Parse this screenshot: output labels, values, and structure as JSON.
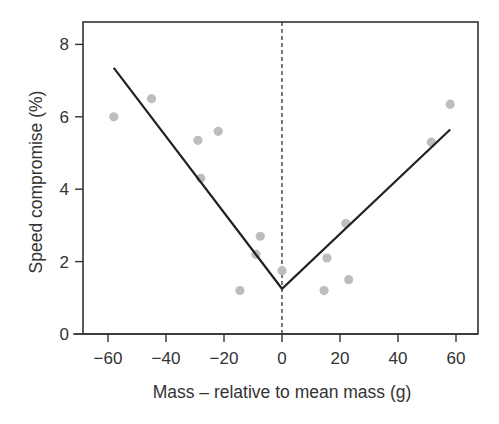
{
  "chart_data": {
    "type": "scatter",
    "title": "",
    "xlabel": "Mass – relative to mean mass (g)",
    "ylabel": "Speed compromise (%)",
    "xlim": [
      -68,
      68
    ],
    "ylim": [
      0,
      8.6
    ],
    "x_ticks": [
      -60,
      -40,
      -20,
      0,
      20,
      40,
      60
    ],
    "x_tick_labels": [
      "−60",
      "−40",
      "−20",
      "0",
      "20",
      "40",
      "60"
    ],
    "y_ticks": [
      0,
      2,
      4,
      6,
      8
    ],
    "y_tick_labels": [
      "0",
      "2",
      "4",
      "6",
      "8"
    ],
    "grid": false,
    "legend": null,
    "series": [
      {
        "name": "observations",
        "kind": "scatter",
        "color": "#bdbdbd",
        "points": [
          {
            "x": -58,
            "y": 6.0
          },
          {
            "x": -45,
            "y": 6.5
          },
          {
            "x": -29,
            "y": 5.35
          },
          {
            "x": -22,
            "y": 5.6
          },
          {
            "x": -28,
            "y": 4.3
          },
          {
            "x": -14.5,
            "y": 1.2
          },
          {
            "x": -9,
            "y": 2.2
          },
          {
            "x": -7.5,
            "y": 2.7
          },
          {
            "x": 0,
            "y": 1.75
          },
          {
            "x": 14.5,
            "y": 1.2
          },
          {
            "x": 15.5,
            "y": 2.1
          },
          {
            "x": 22,
            "y": 3.05
          },
          {
            "x": 23,
            "y": 1.5
          },
          {
            "x": 51.5,
            "y": 5.3
          },
          {
            "x": 58,
            "y": 6.35
          }
        ]
      },
      {
        "name": "piecewise fit",
        "kind": "line",
        "color": "#222222",
        "points": [
          {
            "x": -58,
            "y": 7.35
          },
          {
            "x": 0,
            "y": 1.25
          },
          {
            "x": 58,
            "y": 5.65
          }
        ]
      }
    ],
    "annotations": [
      {
        "type": "vline",
        "x": 0,
        "style": "dashed",
        "color": "#333333"
      }
    ]
  }
}
